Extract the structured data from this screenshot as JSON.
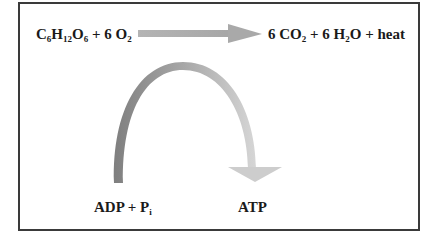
{
  "diagram": {
    "reactants": {
      "parts": [
        "C",
        "6",
        "H",
        "12",
        "O",
        "6",
        " + 6 O",
        "2"
      ]
    },
    "products": {
      "parts": [
        "6 CO",
        "2",
        " + 6 H",
        "2",
        "O + heat"
      ]
    },
    "coupled_left": {
      "parts": [
        "ADP + P",
        "i"
      ]
    },
    "coupled_right": {
      "label": "ATP"
    },
    "colors": {
      "frame": "#3a3a3a",
      "arrow_main": "#a9a9a9",
      "arc_dark": "#8c8c8c",
      "arc_light": "#cfcfcf",
      "text": "#1a1a1a"
    }
  }
}
